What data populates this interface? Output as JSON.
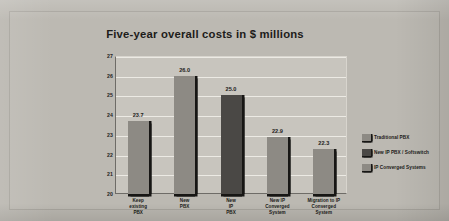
{
  "chart_data": {
    "type": "bar",
    "title": "Five-year overall costs in $ millions",
    "xlabel": "",
    "ylabel": "",
    "ylim": [
      20,
      27
    ],
    "yticks": [
      20,
      21,
      22,
      23,
      24,
      25,
      26,
      27
    ],
    "grid": true,
    "legend_position": "right",
    "categories": [
      "Keep existing PBX",
      "New PBX",
      "New IP PBX",
      "New IP Converged System",
      "Migration to IP Converged System"
    ],
    "category_lines": [
      [
        "Keep",
        "existing",
        "PBX"
      ],
      [
        "New",
        "PBX"
      ],
      [
        "New",
        "IP",
        "PBX"
      ],
      [
        "New IP",
        "Converged",
        "System"
      ],
      [
        "Migration to IP",
        "Converged",
        "System"
      ]
    ],
    "values": [
      23.7,
      26.0,
      25.0,
      22.9,
      22.3
    ],
    "value_labels": [
      "23.7",
      "26.0",
      "25.0",
      "22.9",
      "22.3"
    ],
    "bar_series": [
      "Traditional PBX",
      "Traditional PBX",
      "New IP PBX / Softswitch",
      "IP Converged Systems",
      "IP Converged Systems"
    ],
    "series": [
      {
        "name": "Traditional PBX",
        "color": "#8d8a84"
      },
      {
        "name": "New IP PBX / Softswitch",
        "color": "#4a4845"
      },
      {
        "name": "IP Converged Systems",
        "color": "#8d8a84"
      }
    ],
    "legend": [
      {
        "label": "Traditional PBX",
        "color": "#8d8a84"
      },
      {
        "label": "New IP PBX / Softswitch",
        "color": "#4a4845"
      },
      {
        "label": "IP Converged Systems",
        "color": "#8d8a84"
      }
    ],
    "colors": {
      "page_background": "#b9b6af",
      "panel_background": "#bcb9b2",
      "plot_background": "#c8c5be",
      "gridline": "#eceae4",
      "axis": "#6e6c67",
      "text": "#1d1c1a",
      "bar_shadow": "#171614"
    }
  }
}
